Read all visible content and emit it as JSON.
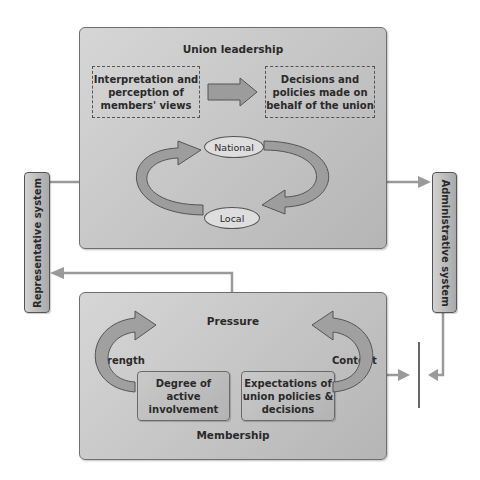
{
  "union_leadership": {
    "title": "Union leadership",
    "interpretation_box": [
      "Interpretation and",
      "perception of",
      "members' views"
    ],
    "decisions_box": [
      "Decisions and",
      "policies made on",
      "behalf of the union"
    ],
    "cycle": {
      "top": "National",
      "bottom": "Local"
    }
  },
  "membership": {
    "title": "Membership",
    "pressure_label": "Pressure",
    "strength_label": "Strength",
    "content_label": "Content",
    "involvement_box": [
      "Degree of",
      "active",
      "involvement"
    ],
    "expectations_box": [
      "Expectations of",
      "union policies &",
      "decisions"
    ]
  },
  "side_systems": {
    "representative": "Representative system",
    "administrative": "Administrative system"
  },
  "colors": {
    "panel": "#c6c6c6",
    "arrow_fill": "#a8a8a8",
    "arrow_dark": "#7d7d7d",
    "connector": "#9a9a9a",
    "text": "#2a2a2a"
  }
}
